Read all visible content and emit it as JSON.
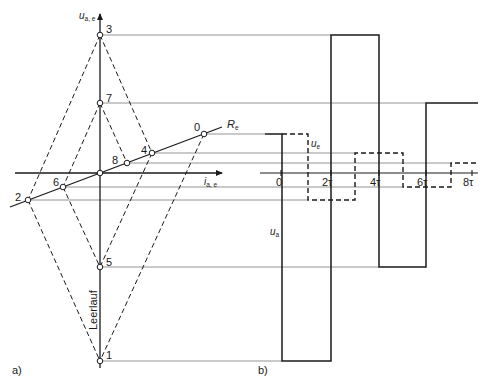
{
  "figure": {
    "panel_a_label": "a)",
    "panel_b_label": "b)",
    "axes_a": {
      "y_axis_label_main": "u",
      "y_axis_label_sub": "a, e",
      "x_axis_label_main": "i",
      "x_axis_label_sub": "a, e",
      "load_line_label_main": "R",
      "load_line_label_sub": "e",
      "open_circuit_label": "Leerlauf"
    },
    "points": [
      {
        "id": "0",
        "label": "0",
        "x": 204,
        "y": 134
      },
      {
        "id": "1",
        "label": "1",
        "x": 100,
        "y": 361
      },
      {
        "id": "2",
        "label": "2",
        "x": 28,
        "y": 200
      },
      {
        "id": "3",
        "label": "3",
        "x": 100,
        "y": 35
      },
      {
        "id": "4",
        "label": "4",
        "x": 152,
        "y": 153
      },
      {
        "id": "5",
        "label": "5",
        "x": 100,
        "y": 267
      },
      {
        "id": "6",
        "label": "6",
        "x": 63,
        "y": 187
      },
      {
        "id": "7",
        "label": "7",
        "x": 100,
        "y": 103
      },
      {
        "id": "8",
        "label": "8",
        "x": 127,
        "y": 163
      }
    ],
    "axes_b": {
      "time_ticks": [
        "0",
        "2τ",
        "4τ",
        "6τ",
        "8τ"
      ],
      "ua_label_main": "u",
      "ua_label_sub": "a",
      "ue_label_main": "u",
      "ue_label_sub": "e"
    },
    "colors": {
      "line": "#1a1a1a",
      "reference_line": "#6e6e6e",
      "background": "#ffffff"
    }
  }
}
